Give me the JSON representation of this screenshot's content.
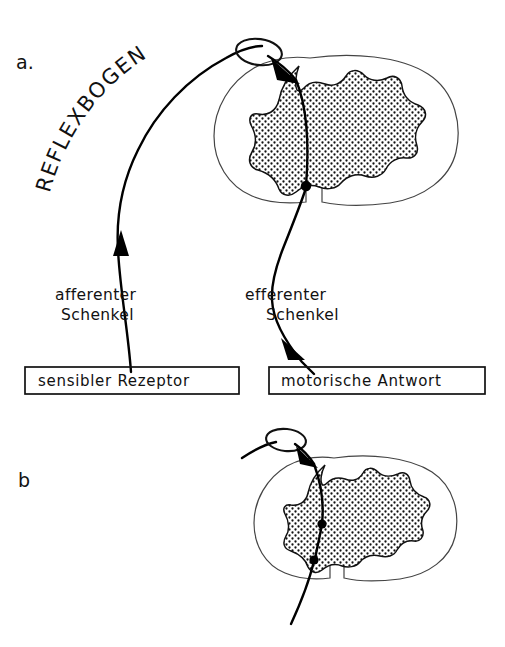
{
  "figure": {
    "title": "Reflexbogen",
    "background_color": "#ffffff",
    "ink_color": "#111111",
    "stipple_color": "#111111"
  },
  "panels": [
    {
      "id": "a",
      "letter": "a.",
      "arc_label": "REFLEXBOGEN",
      "labels": {
        "afferent_line1": "afferenter",
        "afferent_line2": "Schenkel",
        "efferent_line1": "efferenter",
        "efferent_line2": "Schenkel"
      },
      "boxes": [
        {
          "name": "receptor-box",
          "text": "sensibler Rezeptor"
        },
        {
          "name": "response-box",
          "text": "motorische Antwort"
        }
      ],
      "anatomy": {
        "structure": "spinal-cord-cross-section",
        "gray_matter": "butterfly-shaped stippled gray matter",
        "ganglion": "dorsal root ganglion loop",
        "synapse_count": 1
      }
    },
    {
      "id": "b",
      "letter": "b",
      "anatomy": {
        "structure": "spinal-cord-cross-section",
        "gray_matter": "butterfly-shaped stippled gray matter",
        "ganglion": "dorsal root ganglion loop",
        "synapse_count": 2
      }
    }
  ]
}
